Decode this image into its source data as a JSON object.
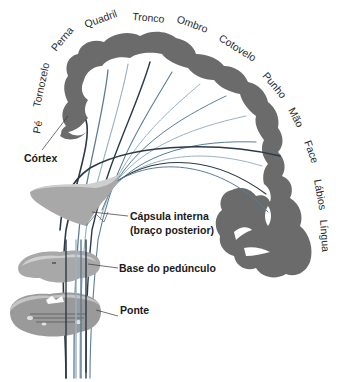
{
  "diagram": {
    "body_map_labels": [
      {
        "id": "pe",
        "text": "Pé"
      },
      {
        "id": "tornozelo",
        "text": "Tornozelo"
      },
      {
        "id": "perna",
        "text": "Perna"
      },
      {
        "id": "quadril",
        "text": "Quadril"
      },
      {
        "id": "tronco",
        "text": "Tronco"
      },
      {
        "id": "ombro",
        "text": "Ombro"
      },
      {
        "id": "cotovelo",
        "text": "Cotovelo"
      },
      {
        "id": "punho",
        "text": "Punho"
      },
      {
        "id": "mao",
        "text": "Mão"
      },
      {
        "id": "face",
        "text": "Face"
      },
      {
        "id": "labios",
        "text": "Lábios"
      },
      {
        "id": "lingua",
        "text": "Língua"
      }
    ],
    "structure_labels": {
      "cortex": "Córtex",
      "capsula_line1": "Cápsula interna",
      "capsula_line2": "(braço posterior)",
      "base_pedunculo": "Base do pedúnculo",
      "ponte": "Ponte"
    },
    "colors": {
      "cortex_gray": "#6b6b6b",
      "slice_gray": "#a8a8a8",
      "slice_light": "#cfcfcf",
      "fiber_dark": "#2b3a48",
      "fiber_blue": "#5a7d96",
      "fiber_light": "#9bb3c4"
    }
  }
}
